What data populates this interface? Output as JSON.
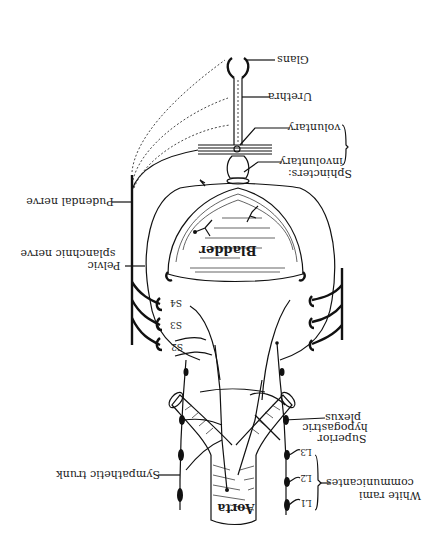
{
  "figure": {
    "orientation": "rotated 180 degrees",
    "colors": {
      "ink": "#111111",
      "background": "#ffffff"
    },
    "labels": {
      "glans": "Glans",
      "urethra": "Urethra",
      "voluntary": "voluntary",
      "involuntary": "involuntary",
      "sphincters": "Sphincters:",
      "pudendal_nerve": "Pudendal nerve",
      "pelvic": "Pelvic",
      "splanchnic_nerve": "splanchnic nerve",
      "bladder": "Bladder",
      "s4": "S4",
      "s3": "S3",
      "s2": "S2",
      "superior": "Superior",
      "hypogastric": "hypogastric",
      "plexus": "plexus",
      "sympathetic_trunk": "Sympathetic trunk",
      "white_rami": "White rami",
      "communicantes": "communicantes",
      "l1": "L1",
      "l2": "L2",
      "l3": "L3",
      "aorta": "Aorta"
    }
  }
}
